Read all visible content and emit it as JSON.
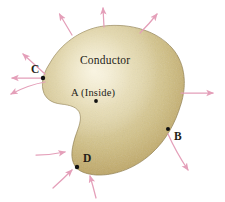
{
  "figure": {
    "background_color": "#ffffff",
    "body_label": "Conductor",
    "inside_label": "A (Inside)",
    "colors": {
      "conductor_edge": "#b09a56",
      "conductor_mid": "#c4b076",
      "conductor_inner": "#ddd2a6",
      "conductor_highlight": "#f0ead0",
      "outline": "#8e7c44",
      "arrow": "#e9a6bd",
      "arrow_dark": "#dd8ca9",
      "dot": "#000000",
      "text": "#241d18"
    },
    "points": [
      {
        "id": "A",
        "label": "A (Inside)",
        "short": "A",
        "location": "interior",
        "x": 96,
        "y": 101
      },
      {
        "id": "B",
        "label": "B",
        "short": "B",
        "location": "surface-right",
        "x": 168,
        "y": 129
      },
      {
        "id": "C",
        "label": "C",
        "short": "C",
        "location": "surface-left",
        "x": 43,
        "y": 77
      },
      {
        "id": "D",
        "label": "D",
        "short": "D",
        "location": "surface-bottom-left",
        "x": 77,
        "y": 167
      }
    ],
    "field_arrows": [
      {
        "id": "arrow-top-left",
        "direction": "outward",
        "x1": 72,
        "y1": 35,
        "x2": 59,
        "y2": 12
      },
      {
        "id": "arrow-top-center",
        "direction": "outward",
        "x1": 104,
        "y1": 27,
        "x2": 103,
        "y2": 6
      },
      {
        "id": "arrow-top-right",
        "direction": "outward",
        "x1": 140,
        "y1": 33,
        "x2": 158,
        "y2": 12
      },
      {
        "id": "arrow-upper-left-c",
        "direction": "outward",
        "x1": 44,
        "y1": 74,
        "x2": 21,
        "y2": 52
      },
      {
        "id": "arrow-left-c",
        "direction": "outward",
        "x1": 44,
        "y1": 78,
        "x2": 9,
        "y2": 78
      },
      {
        "id": "arrow-lower-left-c",
        "direction": "outward",
        "x1": 45,
        "y1": 82,
        "x2": 8,
        "y2": 95
      },
      {
        "id": "arrow-right",
        "direction": "outward",
        "x1": 181,
        "y1": 93,
        "x2": 216,
        "y2": 93
      },
      {
        "id": "arrow-lower-right-b",
        "direction": "outward",
        "x1": 168,
        "y1": 133,
        "x2": 190,
        "y2": 173
      },
      {
        "id": "arrow-into-d-left",
        "direction": "inward",
        "x1": 36,
        "y1": 155,
        "x2": 67,
        "y2": 152
      },
      {
        "id": "arrow-into-d-lower-left",
        "direction": "inward",
        "x1": 53,
        "y1": 188,
        "x2": 73,
        "y2": 168
      },
      {
        "id": "arrow-into-d-below",
        "direction": "inward",
        "x1": 96,
        "y1": 198,
        "x2": 90,
        "y2": 174
      }
    ],
    "legend_note": {
      "outward_meaning": "field points out of surface",
      "inward_meaning": "field points into surface"
    }
  }
}
